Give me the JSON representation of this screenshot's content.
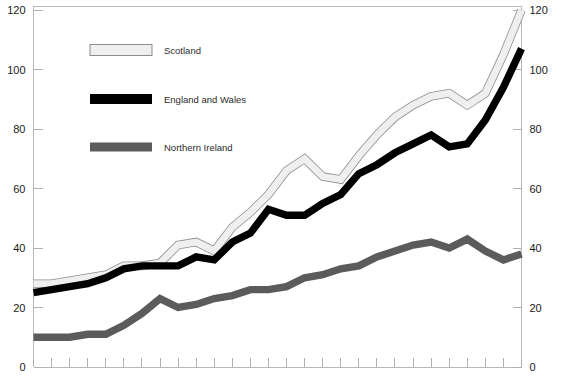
{
  "chart_data": {
    "type": "line",
    "title": "",
    "subtitle": "",
    "xlabel": "",
    "ylabel": "",
    "ylim": [
      0,
      120
    ],
    "xlim": [
      0,
      27
    ],
    "grid": false,
    "legend_position": "upper-left-inside",
    "y_ticks_left": [
      "0",
      "20",
      "40",
      "60",
      "80",
      "100",
      "120"
    ],
    "y_ticks_right": [
      "0",
      "20",
      "40",
      "60",
      "80",
      "100",
      "120"
    ],
    "y_tick_values": [
      0,
      20,
      40,
      60,
      80,
      100,
      120
    ],
    "x_tick_count": 28,
    "x_tick_labels": [],
    "x": [
      0,
      1,
      2,
      3,
      4,
      5,
      6,
      7,
      8,
      9,
      10,
      11,
      12,
      13,
      14,
      15,
      16,
      17,
      18,
      19,
      20,
      21,
      22,
      23,
      24,
      25,
      26,
      27
    ],
    "series": [
      {
        "name": "Scotland",
        "color": "#efefef",
        "outline_color": "#8d8d8d",
        "values": [
          28,
          28,
          29,
          30,
          31,
          34,
          34,
          35,
          41,
          42,
          39,
          47,
          52,
          58,
          66,
          70,
          64,
          63,
          71,
          78,
          84,
          88,
          91,
          92,
          88,
          92,
          105,
          120
        ]
      },
      {
        "name": "England and Wales",
        "color": "#000000",
        "outline_color": "#000000",
        "values": [
          25,
          26,
          27,
          28,
          30,
          33,
          34,
          34,
          34,
          37,
          36,
          42,
          45,
          53,
          51,
          51,
          55,
          58,
          65,
          68,
          72,
          75,
          78,
          74,
          75,
          83,
          94,
          107
        ]
      },
      {
        "name": "Northern Ireland",
        "color": "#5b5b5b",
        "outline_color": "#5b5b5b",
        "values": [
          10,
          10,
          10,
          11,
          11,
          14,
          18,
          23,
          20,
          21,
          23,
          24,
          26,
          26,
          27,
          30,
          31,
          33,
          34,
          37,
          39,
          41,
          42,
          40,
          43,
          39,
          36,
          38
        ]
      }
    ]
  },
  "legend": {
    "entries": [
      {
        "label": "Scotland",
        "swatch": "scotland-swatch"
      },
      {
        "label": "England and Wales",
        "swatch": "england-and-wales-swatch"
      },
      {
        "label": "Northern Ireland",
        "swatch": "northern-ireland-swatch"
      }
    ]
  },
  "axes": {
    "left": {
      "ticks": [
        "120",
        "100",
        "80",
        "60",
        "40",
        "20",
        "0"
      ]
    },
    "right": {
      "ticks": [
        "120",
        "100",
        "80",
        "60",
        "40",
        "20",
        "0"
      ]
    }
  },
  "colors": {
    "scotland": "#efefef",
    "england_and_wales": "#000000",
    "northern_ireland": "#5b5b5b",
    "axis": "#b9b9b9",
    "text": "#1a1a1a",
    "background": "#ffffff"
  }
}
